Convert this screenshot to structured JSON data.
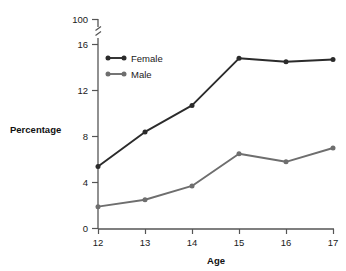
{
  "chart_data": {
    "type": "line",
    "title": "",
    "xlabel": "Age",
    "ylabel": "Percentage",
    "categories": [
      "12",
      "13",
      "14",
      "15",
      "16",
      "17"
    ],
    "x": [
      12,
      13,
      14,
      15,
      16,
      17
    ],
    "series": [
      {
        "name": "Female",
        "color": "#2b2b2b",
        "values": [
          5.4,
          8.4,
          10.7,
          14.8,
          14.5,
          14.7
        ]
      },
      {
        "name": "Male",
        "color": "#6e6e6e",
        "values": [
          1.9,
          2.5,
          3.7,
          6.5,
          5.8,
          7.0
        ]
      }
    ],
    "ylim": [
      0,
      16
    ],
    "ytick_labels": [
      "0",
      "4",
      "8",
      "12",
      "16",
      "100"
    ],
    "ytick_values": [
      0,
      4,
      8,
      12,
      16,
      100
    ],
    "xtick_labels": [
      "12",
      "13",
      "14",
      "15",
      "16",
      "17"
    ],
    "axis_break": true,
    "axis_break_between": [
      16,
      100
    ],
    "grid": false,
    "legend_position": "upper-left-inside"
  },
  "axis": {
    "y_title": "Percentage",
    "x_title": "Age",
    "y_ticks": {
      "t0": "0",
      "t1": "4",
      "t2": "8",
      "t3": "12",
      "t4": "16",
      "t5": "100"
    },
    "x_ticks": {
      "t0": "12",
      "t1": "13",
      "t2": "14",
      "t3": "15",
      "t4": "16",
      "t5": "17"
    }
  },
  "legend": {
    "items": [
      {
        "label": "Female",
        "color": "#2b2b2b"
      },
      {
        "label": "Male",
        "color": "#6e6e6e"
      }
    ]
  },
  "colors": {
    "female": "#2b2b2b",
    "male": "#6e6e6e",
    "axis": "#555555",
    "text": "#1a1a1a",
    "background": "#ffffff"
  }
}
